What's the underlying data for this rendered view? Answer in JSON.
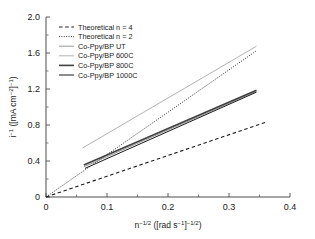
{
  "chart_data": {
    "type": "line",
    "title": "",
    "xlabel": "n^-1/2 ([rad s^-1]^-1/2)",
    "ylabel": "i^-1 ([mA cm^-2]^-1)",
    "xlim": [
      0,
      0.4
    ],
    "ylim": [
      0,
      2.0
    ],
    "grid": false,
    "legend_position": "upper left",
    "x_ticks": [
      "0",
      "0.1",
      "0.2",
      "0.3",
      "0.4"
    ],
    "x_tick_values": [
      0,
      0.1,
      0.2,
      0.3,
      0.4
    ],
    "y_ticks": [
      "0",
      "0.4",
      "0.8",
      "1.2",
      "1.6",
      "2.0"
    ],
    "y_tick_values": [
      0,
      0.4,
      0.8,
      1.2,
      1.6,
      2.0
    ],
    "x_minor_ticks": [
      0.05,
      0.15,
      0.25,
      0.35
    ],
    "y_minor_ticks": [
      0.2,
      0.6,
      1.0,
      1.4,
      1.8
    ],
    "series": [
      {
        "name": "Theoretical n = 4",
        "style": "dashed",
        "color": "#1a1a1a",
        "width": 1.1,
        "x": [
          0.0,
          0.36
        ],
        "y": [
          0.0,
          0.83
        ]
      },
      {
        "name": "Theoretical n = 2",
        "style": "dotted",
        "color": "#1a1a1a",
        "width": 1.0,
        "x": [
          0.0,
          0.345
        ],
        "y": [
          0.0,
          1.625
        ]
      },
      {
        "name": "Co-Ppy/BP UT",
        "style": "solid",
        "color": "#8c8c8c",
        "width": 0.9,
        "x": [
          0.062,
          0.345
        ],
        "y": [
          0.335,
          1.175
        ]
      },
      {
        "name": "Co-Ppy/BP 600C",
        "style": "solid",
        "color": "#b3b3b3",
        "width": 1.0,
        "x": [
          0.06,
          0.345
        ],
        "y": [
          0.545,
          1.675
        ]
      },
      {
        "name": "Co-Ppy/BP 800C",
        "style": "solid",
        "color": "#404040",
        "width": 1.6,
        "x": [
          0.062,
          0.345
        ],
        "y": [
          0.355,
          1.185
        ]
      },
      {
        "name": "Co-Ppy/BP 1000C",
        "style": "solid",
        "color": "#1a1a1a",
        "width": 1.0,
        "x": [
          0.064,
          0.345
        ],
        "y": [
          0.318,
          1.165
        ]
      }
    ]
  },
  "axis": {
    "y_label_parts": {
      "base": "i",
      "exp": "−1",
      "unit_open": " ([mA cm",
      "unit_exp": "−2",
      "unit_close": "]",
      "unit_exp2": "−1",
      "tail": ")"
    },
    "x_label_parts": {
      "base": "n",
      "exp": "−1/2",
      "unit_open": " ([rad s",
      "unit_exp": "−1",
      "unit_close": "]",
      "unit_exp2": "−1/2",
      "tail": ")"
    }
  },
  "legend": {
    "items": [
      {
        "label": "Theoretical n = 4"
      },
      {
        "label": "Theoretical n = 2"
      },
      {
        "label": "Co-Ppy/BP UT"
      },
      {
        "label": "Co-Ppy/BP 600C"
      },
      {
        "label": "Co-Ppy/BP 800C"
      },
      {
        "label": "Co-Ppy/BP 1000C"
      }
    ]
  }
}
